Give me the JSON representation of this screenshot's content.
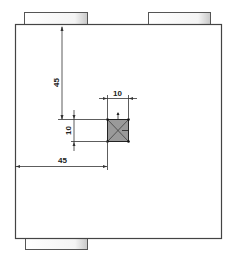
{
  "drawing": {
    "type": "engineering-drawing",
    "dimensions": {
      "vertical_offset": "45",
      "horizontal_offset": "45",
      "square_width": "10",
      "square_height": "10"
    },
    "colors": {
      "outline": "#444444",
      "square_fill": "#9a9a9a",
      "dimension_line": "#333333",
      "background": "#ffffff"
    }
  }
}
